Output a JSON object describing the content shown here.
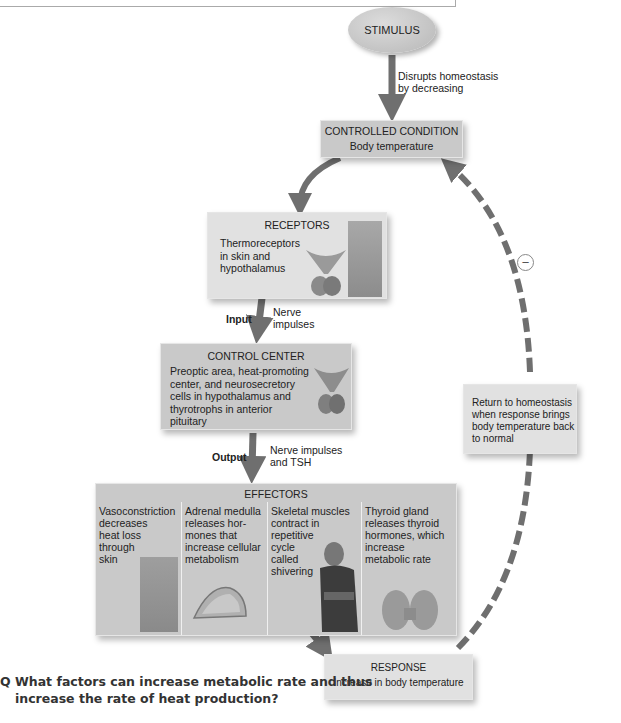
{
  "stimulus": {
    "label": "STIMULUS",
    "arrow_text": "Disrupts homeostasis by decreasing",
    "arrow_text_lines": [
      "Disrupts homeostasis",
      "by decreasing"
    ]
  },
  "controlled_condition": {
    "title": "CONTROLLED CONDITION",
    "text": "Body temperature"
  },
  "receptors": {
    "title": "RECEPTORS",
    "lines": [
      "Thermoreceptors",
      "in skin and",
      "hypothalamus"
    ]
  },
  "input": {
    "label": "Input",
    "lines": [
      "Nerve",
      "impulses"
    ]
  },
  "control_center": {
    "title": "CONTROL CENTER",
    "lines": [
      "Preoptic area, heat-promoting",
      "center, and neurosecretory",
      "cells in hypothalamus and",
      "thyrotrophs in anterior",
      "pituitary"
    ]
  },
  "output": {
    "label": "Output",
    "lines": [
      "Nerve impulses",
      "and TSH"
    ]
  },
  "effectors": {
    "title": "EFFECTORS",
    "columns": [
      {
        "lines": [
          "Vasoconstriction",
          "decreases",
          "heat loss",
          "through",
          "skin"
        ],
        "image": "skin-cross-section"
      },
      {
        "lines": [
          "Adrenal medulla",
          "releases hor-",
          "mones that",
          "increase cellular",
          "metabolism"
        ],
        "image": "adrenal-gland"
      },
      {
        "lines": [
          "Skeletal muscles",
          "contract in",
          "repetitive",
          "cycle",
          "called",
          "shivering"
        ],
        "image": "shivering-person"
      },
      {
        "lines": [
          "Thyroid gland",
          "releases thyroid",
          "hormones, which",
          "increase",
          "metabolic rate"
        ],
        "image": "thyroid-gland"
      }
    ]
  },
  "response": {
    "title": "RESPONSE",
    "text": "Increase in body temperature"
  },
  "feedback": {
    "lines": [
      "Return to homeostasis",
      "when response brings",
      "body temperature back",
      "to normal"
    ],
    "sign": "−",
    "type": "negative"
  },
  "question": {
    "marker": "Q",
    "lines": [
      "What factors can increase metabolic rate and thus",
      "increase the rate of heat production?"
    ]
  },
  "colors": {
    "arrow": "#6f6f6f",
    "box_dark": "#c9c9c9",
    "box_light": "#e1e1e1"
  }
}
